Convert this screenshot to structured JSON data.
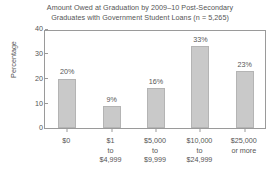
{
  "chart_data": {
    "type": "bar",
    "title": "Amount Owed at Graduation by 2009–10 Post-Secondary\nGraduates with Government Student Loans (n = 5,265)",
    "xlabel": "",
    "ylabel": "Percentage",
    "categories": [
      "$0",
      "$1\nto\n$4,999",
      "$5,000\nto\n$9,999",
      "$10,000\nto\n$24,999",
      "$25,000\nor more"
    ],
    "values": [
      20,
      9,
      16,
      33,
      23
    ],
    "value_labels": [
      "20%",
      "9%",
      "16%",
      "33%",
      "23%"
    ],
    "ylim": [
      0,
      40
    ],
    "yticks": [
      0,
      10,
      20,
      30,
      40
    ],
    "ytick_labels": [
      "0",
      "10",
      "20",
      "30",
      "40"
    ],
    "grid": false,
    "legend": false,
    "bar_color": "#c9c9c9",
    "bar_border_color": "#b4b4b4",
    "axis_color": "#9a9a9a",
    "text_color": "#555555",
    "background": "#ffffff"
  }
}
